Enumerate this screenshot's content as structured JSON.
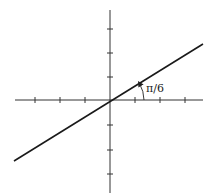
{
  "diagram": {
    "angle_label": "π/6",
    "angle_radians": 0.5236,
    "colors": {
      "axes": "#333333",
      "line": "#1a1a1a",
      "background": "#ffffff"
    },
    "x_axis": {
      "ticks_negative": 3,
      "ticks_positive": 3
    },
    "y_axis": {
      "ticks_negative": 3,
      "ticks_positive": 3
    }
  }
}
